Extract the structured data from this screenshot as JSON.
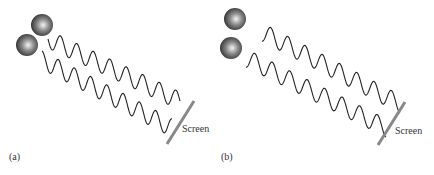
{
  "panels": [
    {
      "id": "a",
      "label": "(a)",
      "screen_label": "Screen"
    },
    {
      "id": "b",
      "label": "(b)",
      "screen_label": "Screen"
    }
  ],
  "colors": {
    "wave": "#222222",
    "screen": "#888888",
    "ball_dark": "#2a2a2a",
    "ball_light": "#f2f2f2"
  }
}
